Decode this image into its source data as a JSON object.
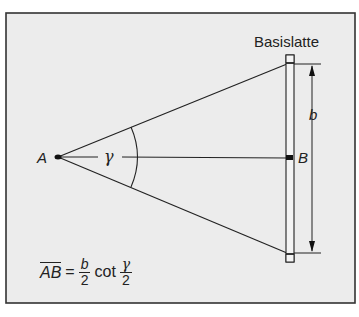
{
  "title": "Basislatte",
  "points": {
    "A": "A",
    "B": "B"
  },
  "labels": {
    "b": "b",
    "gamma": "γ"
  },
  "formula": {
    "lhs": "AB",
    "equals": "=",
    "frac1": {
      "num": "b",
      "den": "2"
    },
    "func": "cot",
    "frac2": {
      "num": "γ",
      "den": "2"
    }
  },
  "colors": {
    "background": "#ececec",
    "line": "#222222",
    "frame": "#333333"
  }
}
